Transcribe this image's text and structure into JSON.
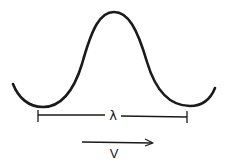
{
  "diagram": {
    "type": "wave-diagram",
    "wave": {
      "shape": "single wave crest between two troughs",
      "stroke_color": "#1a1a1a"
    },
    "wavelength": {
      "symbol": "λ",
      "span": "trough to trough"
    },
    "velocity": {
      "symbol": "V",
      "direction": "right"
    }
  }
}
